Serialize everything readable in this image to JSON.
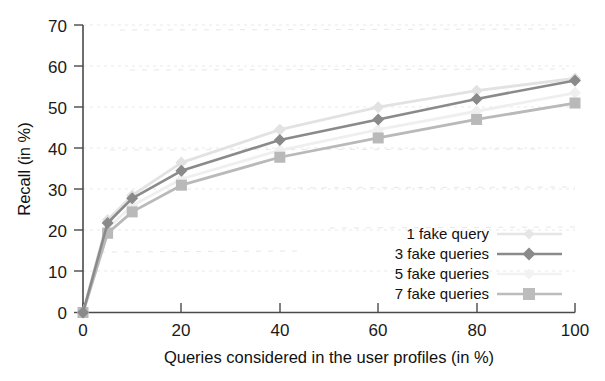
{
  "chart_data": {
    "type": "line",
    "title": "",
    "xlabel": "Queries considered in the user profiles (in %)",
    "ylabel": "Recall (in %)",
    "xlim": [
      0,
      100
    ],
    "ylim": [
      0,
      70
    ],
    "xticks": [
      0,
      20,
      40,
      60,
      80,
      100
    ],
    "yticks": [
      0,
      10,
      20,
      30,
      40,
      50,
      60,
      70
    ],
    "grid": true,
    "legend_position": "lower-right inside axes",
    "x": [
      0,
      5,
      10,
      20,
      40,
      60,
      80,
      100
    ],
    "series": [
      {
        "name": "1 fake query",
        "color": "#e2e2e2",
        "marker": "diamond",
        "values": [
          0,
          22.5,
          28.5,
          36.5,
          44.5,
          50.0,
          54.0,
          57.0
        ]
      },
      {
        "name": "3 fake queries",
        "color": "#8a8a8a",
        "marker": "diamond",
        "values": [
          0,
          21.8,
          27.8,
          34.5,
          42.0,
          47.0,
          52.0,
          56.5
        ]
      },
      {
        "name": "5 fake queries",
        "color": "#efefef",
        "marker": "diamond",
        "values": [
          0,
          20.5,
          26.0,
          32.5,
          39.5,
          44.5,
          49.0,
          53.5
        ]
      },
      {
        "name": "7 fake queries",
        "color": "#b9b9b9",
        "marker": "square",
        "values": [
          0,
          19.3,
          24.5,
          31.0,
          37.8,
          42.5,
          47.0,
          51.0
        ]
      }
    ]
  },
  "axes": {
    "y_tick_labels": [
      "0",
      "10",
      "20",
      "30",
      "40",
      "50",
      "60",
      "70"
    ],
    "x_tick_labels": [
      "0",
      "20",
      "40",
      "60",
      "80",
      "100"
    ],
    "x_axis_title": "Queries considered in the user profiles (in %)",
    "y_axis_title": "Recall (in %)"
  },
  "legend": {
    "entries": [
      {
        "label": "1 fake query",
        "marker": "diamond-light"
      },
      {
        "label": "3 fake queries",
        "marker": "diamond-dark"
      },
      {
        "label": "5 fake queries",
        "marker": "diamond-faint"
      },
      {
        "label": "7 fake queries",
        "marker": "square-gray"
      }
    ]
  },
  "colors": {
    "axis": "#4a4a4a",
    "grid": "#e9e9e9",
    "series_1": "#e2e2e2",
    "series_3": "#8a8a8a",
    "series_5": "#efefef",
    "series_7": "#b9b9b9",
    "text": "#111111",
    "background": "#ffffff"
  }
}
